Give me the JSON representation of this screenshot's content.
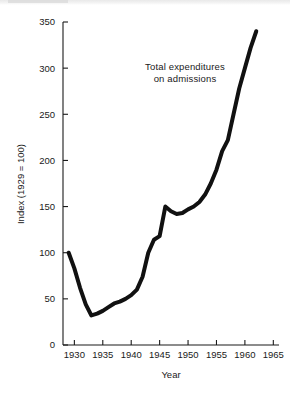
{
  "chart_data": {
    "type": "line",
    "title": "",
    "subtitle": "",
    "xlabel": "Year",
    "ylabel": "Index (1929 = 100)",
    "xlim": [
      1928,
      1966
    ],
    "ylim": [
      0,
      350
    ],
    "grid": false,
    "legend_position": "none",
    "annotations": [
      {
        "name": "series-label",
        "line1": "Total expenditures",
        "line2": "on admissions",
        "x": 1947,
        "y": 300
      }
    ],
    "xticks": [
      1930,
      1935,
      1940,
      1945,
      1950,
      1955,
      1960,
      1965
    ],
    "xtick_labels": [
      "1930",
      "1935",
      "1940",
      "1945",
      "1950",
      "1955",
      "1960",
      "1965"
    ],
    "yticks": [
      0,
      50,
      100,
      150,
      200,
      250,
      300,
      350
    ],
    "ytick_labels": [
      "0",
      "50",
      "100",
      "150",
      "200",
      "250",
      "300",
      "350"
    ],
    "series": [
      {
        "name": "Total expenditures on admissions",
        "color": "#111111",
        "line_width": 4,
        "x": [
          1929,
          1930,
          1931,
          1932,
          1933,
          1934,
          1935,
          1936,
          1937,
          1938,
          1939,
          1940,
          1941,
          1942,
          1943,
          1944,
          1945,
          1946,
          1947,
          1948,
          1949,
          1950,
          1951,
          1952,
          1953,
          1954,
          1955,
          1956,
          1957,
          1958,
          1959,
          1960,
          1961,
          1962
        ],
        "values": [
          100,
          83,
          62,
          44,
          32,
          34,
          37,
          41,
          45,
          47,
          50,
          54,
          60,
          74,
          100,
          114,
          118,
          150,
          145,
          142,
          143,
          147,
          150,
          155,
          163,
          175,
          190,
          210,
          222,
          250,
          278,
          300,
          322,
          340
        ]
      }
    ]
  },
  "axes": {
    "y_axis_name": "Index (1929 = 100)",
    "x_axis_name": "Year"
  }
}
